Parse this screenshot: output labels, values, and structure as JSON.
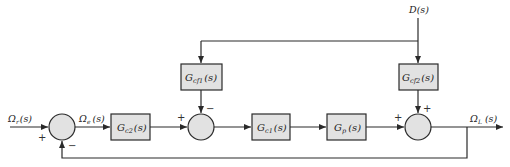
{
  "diagram": {
    "type": "block-diagram",
    "background": "#ffffff",
    "block_fill": "#e2e2e2",
    "line_color": "#2a2a2a",
    "signals": {
      "reference": {
        "main": "Ω",
        "sub": "r",
        "arg": "(s)"
      },
      "error": {
        "main": "Ω",
        "sub": "e",
        "arg": "(s)"
      },
      "output": {
        "main": "Ω",
        "sub": "L",
        "arg": "(s)"
      },
      "disturbance": {
        "main": "D",
        "arg": "(s)"
      }
    },
    "blocks": [
      {
        "id": "gc2",
        "main": "G",
        "sub": "c2",
        "arg": "(s)"
      },
      {
        "id": "gcf1",
        "main": "G",
        "sub": "cf1",
        "arg": "(s)"
      },
      {
        "id": "gc1",
        "main": "G",
        "sub": "c1",
        "arg": "(s)"
      },
      {
        "id": "gp",
        "main": "G",
        "sub": "p",
        "arg": "(s)"
      },
      {
        "id": "gcf2",
        "main": "G",
        "sub": "cf2",
        "arg": "(s)"
      }
    ],
    "junctions": [
      {
        "id": "sum1",
        "signs": {
          "left": "+",
          "bottom": "−"
        }
      },
      {
        "id": "sum2",
        "signs": {
          "left": "+",
          "top": "−"
        }
      },
      {
        "id": "sum3",
        "signs": {
          "left": "+",
          "top": "+"
        }
      }
    ]
  }
}
